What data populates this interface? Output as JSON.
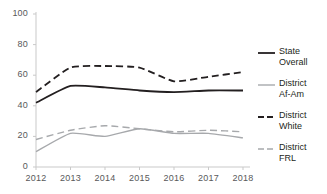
{
  "chart_data": {
    "type": "line",
    "title": "",
    "xlabel": "",
    "ylabel": "",
    "categories": [
      "2012",
      "2013",
      "2014",
      "2015",
      "2016",
      "2017",
      "2018"
    ],
    "x": [
      2012,
      2013,
      2014,
      2015,
      2016,
      2017,
      2018
    ],
    "ylim": [
      0,
      100
    ],
    "yticks": [
      "0",
      "20",
      "40",
      "60",
      "80",
      "100"
    ],
    "ytick_values": [
      0,
      20,
      40,
      60,
      80,
      100
    ],
    "grid": false,
    "legend_position": "right",
    "series": [
      {
        "name": "State Overall",
        "label": "State\nOverall",
        "style": "solid",
        "color": "#231f20",
        "width": 1.8,
        "values": [
          42,
          53,
          52,
          50,
          49,
          50,
          50
        ]
      },
      {
        "name": "District Af-Am",
        "label": "District\nAf-Am",
        "style": "solid",
        "color": "#a7a9ac",
        "width": 1.4,
        "values": [
          10,
          22,
          20,
          25,
          22,
          22,
          19
        ]
      },
      {
        "name": "District White",
        "label": "District\nWhite",
        "style": "dashed",
        "color": "#231f20",
        "width": 1.8,
        "values": [
          49,
          65,
          66,
          65,
          56,
          59,
          62
        ]
      },
      {
        "name": "District FRL",
        "label": "District\nFRL",
        "style": "dashed",
        "color": "#a7a9ac",
        "width": 1.4,
        "values": [
          18,
          24,
          27,
          25,
          23,
          24,
          23
        ]
      }
    ]
  },
  "axis": {
    "axis_color": "#c9c9c9",
    "tick_color": "#c9c9c9",
    "label_color": "#58585a"
  }
}
